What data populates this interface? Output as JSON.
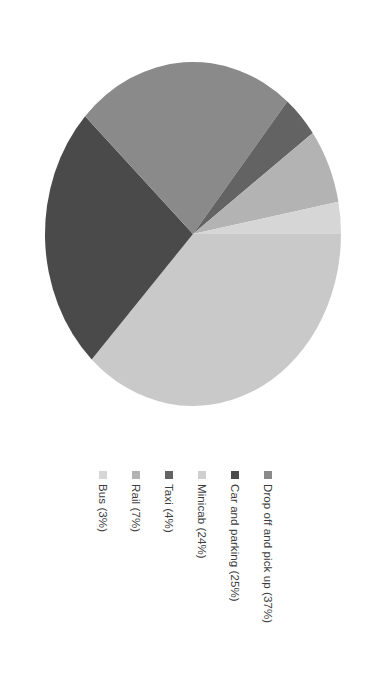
{
  "chart_data": {
    "type": "pie",
    "title": "",
    "subtitle": "",
    "xlabel": "",
    "ylabel": "",
    "grid": false,
    "legend_position": "bottom",
    "rotation_degrees": 90,
    "unit": "%",
    "categories": [
      "Drop off and pick up",
      "Car and parking",
      "Minicab",
      "Taxi",
      "Rail",
      "Bus"
    ],
    "values": [
      37,
      25,
      24,
      4,
      7,
      3
    ],
    "slices": [
      {
        "label": "Drop off and pick up",
        "value": 37,
        "legend_text": "Drop off and pick up (37%)",
        "color": "#c9c9c9"
      },
      {
        "label": "Car and parking",
        "value": 25,
        "legend_text": "Car and parking (25%)",
        "color": "#4a4a4a"
      },
      {
        "label": "Minicab",
        "value": 24,
        "legend_text": "Minicab (24%)",
        "color": "#8a8a8a"
      },
      {
        "label": "Taxi",
        "value": 4,
        "legend_text": "Taxi (4%)",
        "color": "#636363"
      },
      {
        "label": "Rail",
        "value": 7,
        "legend_text": "Rail (7%)",
        "color": "#b3b3b3"
      },
      {
        "label": "Bus",
        "value": 3,
        "legend_text": "Bus (3%)",
        "color": "#d6d6d6"
      }
    ]
  },
  "legend": {
    "entries": [
      {
        "label": "Bus (3%)",
        "color": "#d6d6d6"
      },
      {
        "label": "Rail (7%)",
        "color": "#b3b3b3"
      },
      {
        "label": "Taxi (4%)",
        "color": "#636363"
      },
      {
        "label": "Minicab (24%)",
        "color": "#cfcfcf"
      },
      {
        "label": "Car and parking (25%)",
        "color": "#4a4a4a"
      },
      {
        "label": "Drop off and pick up (37%)",
        "color": "#8a8a8a"
      }
    ]
  },
  "colors": {
    "background": "#ffffff",
    "text": "#3c3c3c",
    "slice_light": "#c9c9c9",
    "slice_dark": "#4a4a4a",
    "slice_medium": "#8a8a8a"
  }
}
